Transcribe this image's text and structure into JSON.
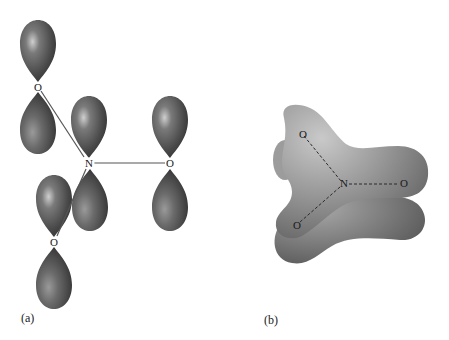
{
  "figure": {
    "panel_a": {
      "label": "(a)",
      "atoms": {
        "o_top": "O",
        "n_center": "N",
        "o_right": "O",
        "o_bottom": "O"
      },
      "description": "Unhybridized p orbitals on N and three O atoms, shown as dumbbell lobes perpendicular to the molecular plane"
    },
    "panel_b": {
      "label": "(b)",
      "atoms": {
        "o_top": "O",
        "n_center": "N",
        "o_right": "O",
        "o_bottom": "O"
      },
      "description": "Delocalized pi molecular orbital cloud above and below the trigonal planar NO3 framework"
    },
    "colors": {
      "lobe_dark": "#3a3a3a",
      "lobe_mid": "#6a6a6a",
      "lobe_highlight": "#c8c8c8",
      "cloud_dark": "#5a5a5a",
      "cloud_mid": "#8e8e8e",
      "cloud_light": "#bdbdbd",
      "background": "#ffffff"
    }
  }
}
